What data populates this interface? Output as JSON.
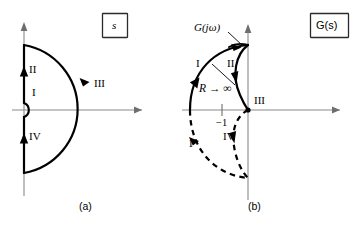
{
  "figure": {
    "title_boxes": [
      {
        "name": "s-plane-box",
        "label": "s",
        "italic": true
      },
      {
        "name": "gs-plane-box",
        "label": "G(s)",
        "italic": false
      }
    ],
    "captions": [
      {
        "name": "caption-a",
        "label": "(a)"
      },
      {
        "name": "caption-b",
        "label": "(b)"
      }
    ],
    "panel_a": {
      "name": "s-plane-contour",
      "caption": "(a)",
      "plane_label": "s",
      "segment_labels": [
        {
          "id": "I",
          "label": "I",
          "desc": "small-indent-semicircle-at-origin"
        },
        {
          "id": "II",
          "label": "II",
          "desc": "upper-imaginary-axis-segment"
        },
        {
          "id": "III",
          "label": "III",
          "desc": "large-semicircle-radius-R"
        },
        {
          "id": "IV",
          "label": "IV",
          "desc": "lower-imaginary-axis-segment"
        }
      ],
      "axes": {
        "real_axis": "horizontal",
        "imag_axis": "vertical"
      }
    },
    "panel_b": {
      "name": "gs-plane-nyquist-plot",
      "caption": "(b)",
      "plane_label": "G(s)",
      "curve_label": "G(jω)",
      "radius_label": "R → ∞",
      "critical_point_label": "−1",
      "segment_labels": [
        {
          "id": "I",
          "label": "I",
          "desc": "upper-image-of-large-arc"
        },
        {
          "id": "II",
          "label": "II",
          "desc": "upper-image-of-imaginary-axis"
        },
        {
          "id": "III",
          "label": "III",
          "desc": "image-converging-at-origin"
        },
        {
          "id": "IV",
          "label": "IV",
          "desc": "lower-image-of-imaginary-axis"
        },
        {
          "id": "I-lower",
          "label": "I",
          "desc": "lower-image-of-large-arc-dashed"
        }
      ],
      "axes": {
        "real_axis": "horizontal",
        "imag_axis": "vertical"
      }
    }
  },
  "colors": {
    "contour": "#000000",
    "axis": "#8a8a8a",
    "background": "#ffffff",
    "box_border": "#2b2b2b"
  }
}
